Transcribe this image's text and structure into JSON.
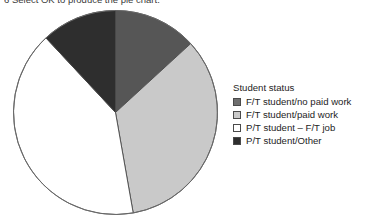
{
  "page": {
    "instruction_line": "6  Select OK to produce the pie chart."
  },
  "legend": {
    "title": "Student status",
    "items": [
      {
        "label": "F/T student/no paid work",
        "swatch_name": "legend-swatch-ft-no-paid-work",
        "color": "#6e6e6e"
      },
      {
        "label": "F/T student/paid work",
        "swatch_name": "legend-swatch-ft-paid-work",
        "color": "#c9c9c9"
      },
      {
        "label": "P/T student – F/T job",
        "swatch_name": "legend-swatch-pt-ft-job",
        "color": "#ffffff"
      },
      {
        "label": "P/T student/Other",
        "swatch_name": "legend-swatch-pt-other",
        "color": "#2e2e2e"
      }
    ]
  },
  "chart_data": {
    "type": "pie",
    "title": "",
    "legend_title": "Student status",
    "legend_position": "right",
    "start_angle_deg": 0,
    "direction": "clockwise",
    "center_px": [
      115,
      112
    ],
    "radius_px": 102,
    "categories": [
      "F/T student/no paid work",
      "F/T student/paid work",
      "P/T student – F/T job",
      "P/T student/Other"
    ],
    "values": [
      13.2,
      34.0,
      40.9,
      11.9
    ],
    "angles_deg": [
      47.5,
      122.5,
      147.0,
      43.0
    ],
    "colors": [
      "#565656",
      "#c9c9c9",
      "#ffffff",
      "#2e2e2e"
    ],
    "slice_border_color": "#4a4a4a",
    "units": "percent",
    "grid": false
  }
}
